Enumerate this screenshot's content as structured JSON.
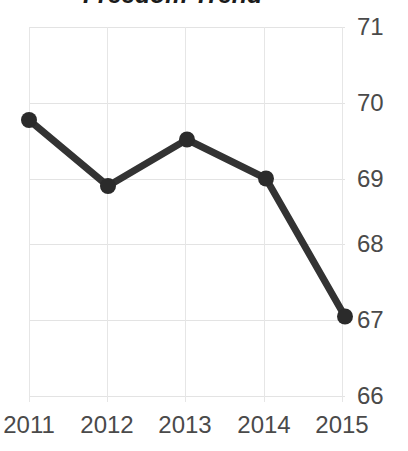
{
  "chart_data": {
    "type": "line",
    "title": "Freedom Trend",
    "xlabel": "",
    "ylabel": "",
    "categories": [
      "2011",
      "2012",
      "2013",
      "2014",
      "2015"
    ],
    "x": [
      2011,
      2012,
      2013,
      2014,
      2015
    ],
    "values": [
      69.76,
      68.88,
      69.5,
      68.98,
      67.14
    ],
    "series": [
      {
        "name": "Freedom Score",
        "values": [
          69.76,
          68.88,
          69.5,
          68.98,
          67.14
        ]
      }
    ],
    "ylim": [
      66,
      71
    ],
    "yticks": [
      71,
      70,
      69,
      68,
      67,
      66
    ],
    "xticks": [
      "2011",
      "2012",
      "2013",
      "2014",
      "2015"
    ],
    "grid": true,
    "gridlines": "both",
    "legend": "none",
    "y_axis_position": "right",
    "markers": "circle",
    "line_color": "#333333",
    "marker_color": "#2b2b2b",
    "grid_color": "#e3e3e3",
    "tick_label_color": "#4a4a4a",
    "title_color": "#1b1b1b",
    "background_color": "#ffffff",
    "annotations": []
  }
}
